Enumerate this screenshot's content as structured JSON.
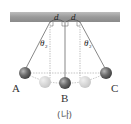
{
  "diagram": {
    "caption": "(나)",
    "ceiling": {
      "label": "support bar"
    },
    "distances": [
      {
        "symbol": "d",
        "side": "left"
      },
      {
        "symbol": "d",
        "side": "right"
      }
    ],
    "angles": [
      {
        "symbol": "θ",
        "subscript": "2",
        "side": "left"
      },
      {
        "symbol": "θ",
        "subscript": "2",
        "side": "right"
      }
    ],
    "balls": [
      {
        "label": "A",
        "position": "left",
        "state": "displaced"
      },
      {
        "label": "B",
        "position": "center",
        "state": "rest"
      },
      {
        "label": "C",
        "position": "right",
        "state": "displaced"
      }
    ],
    "colors": {
      "ceiling": "#9a9a9a",
      "ball_dark": "#6e6e6e",
      "ball_ghost": "#cfcfcf",
      "string": "#555555",
      "dashed": "#888888"
    }
  }
}
